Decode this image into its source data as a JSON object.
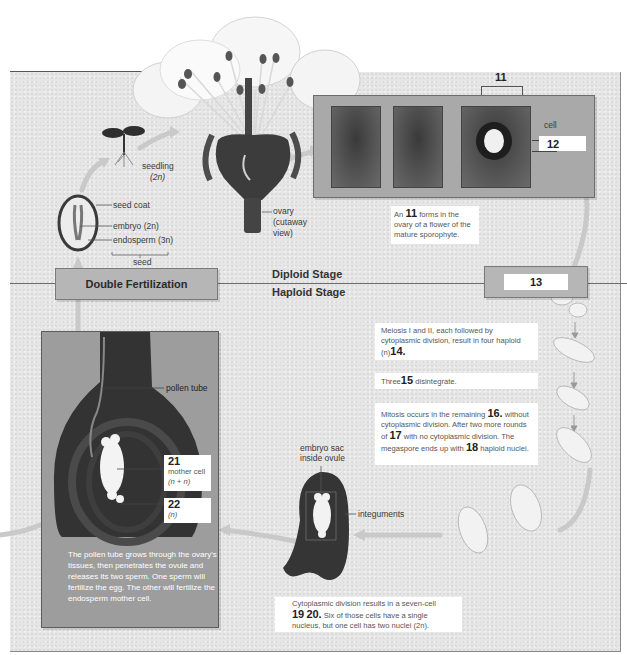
{
  "flower": {
    "ovary_label": "ovary",
    "ovary_sub1": "(cutaway",
    "ovary_sub2": "view)"
  },
  "seedling": {
    "label": "seedling",
    "ploidy": "(2n)"
  },
  "seed": {
    "coat_label": "seed coat",
    "embryo_label": "embryo (2n)",
    "endosperm_label": "endosperm (3n)",
    "bracket_label": "seed"
  },
  "ovule_photos": {
    "bracket_number": "11",
    "cell_label": "cell",
    "answer_12": "12",
    "caption_prefix": "An",
    "caption_number": "11",
    "caption_rest": "forms in the ovary of a flower of the mature sporophyte."
  },
  "stages": {
    "double_fertilization": "Double Fertilization",
    "diploid": "Diploid Stage",
    "haploid": "Haploid Stage",
    "box_13": "13"
  },
  "meiosis": {
    "text": "Meiosis I and II, each followed by cytoplasmic division, result in four haploid (n)",
    "number": "14."
  },
  "three": {
    "prefix": "Three",
    "number": "15",
    "suffix": "disintegrate."
  },
  "mitosis": {
    "part1": "Mitosis occurs in the remaining",
    "num16": "16.",
    "part2": "without cytoplasmic division. After two more rounds of",
    "num17": "17",
    "part3": "with no cytoplasmic division. The megaspore ends up with",
    "num18": "18",
    "part4": "haploid nuclei."
  },
  "embryo_sac": {
    "label_line1": "embryo sac",
    "label_line2": "inside ovule",
    "integuments": "integuments"
  },
  "cytoplasmic": {
    "part1": "Cytoplasmic division results in a seven-cell",
    "num19": "19",
    "num20": "20.",
    "part2": "Six of those cells have a single nucleus, but one cell has two nuclei (2n)."
  },
  "pollen": {
    "tube_label": "pollen tube",
    "num21": "21",
    "mother_cell": "mother cell",
    "mother_ploidy": "(n + n)",
    "num22": "22",
    "ploidy22": "(n)",
    "caption": "The pollen tube grows through the ovary's tissues, then penetrates the ovule and releases its two sperm. One sperm will fertilize the egg. The other will fertilize the endosperm mother cell."
  },
  "colors": {
    "panel_bg": "#e6e6e6",
    "stage_box": "#b6b6b6",
    "arrow": "#c8c8c8",
    "dark_tissue": "#3c3c3c"
  }
}
